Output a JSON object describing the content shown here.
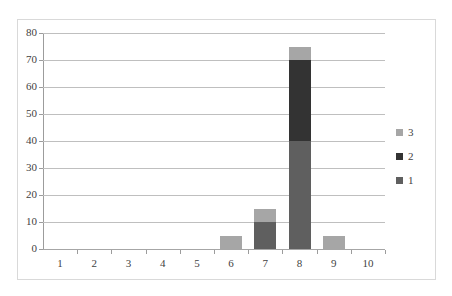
{
  "chart_data": {
    "type": "bar",
    "subtype": "stacked-column",
    "title": "",
    "subtitle": "",
    "xlabel": "",
    "ylabel": "",
    "categories": [
      "1",
      "2",
      "3",
      "4",
      "5",
      "6",
      "7",
      "8",
      "9",
      "10"
    ],
    "series": [
      {
        "name": "1",
        "color": "#5f5f5f",
        "values": [
          0,
          0,
          0,
          0,
          0,
          0,
          10,
          40,
          0,
          0
        ]
      },
      {
        "name": "2",
        "color": "#333333",
        "values": [
          0,
          0,
          0,
          0,
          0,
          0,
          0,
          30,
          0,
          0
        ]
      },
      {
        "name": "3",
        "color": "#a6a6a6",
        "values": [
          0,
          0,
          0,
          0,
          0,
          5,
          5,
          5,
          5,
          0
        ]
      }
    ],
    "totals": [
      0,
      0,
      0,
      0,
      0,
      5,
      15,
      75,
      5,
      0
    ],
    "ylim": [
      0,
      80
    ],
    "ytick_step": 10,
    "ytick_labels": [
      "0",
      "10",
      "20",
      "30",
      "40",
      "50",
      "60",
      "70",
      "80"
    ],
    "grid": true,
    "grid_axis": "y",
    "legend_position": "right",
    "legend_entries": [
      "3",
      "2",
      "1"
    ],
    "plot_background": "#ffffff",
    "gridline_color": "#bfbfbf",
    "border_color": "#d9d9d9",
    "axis_color": "#9c9c9c",
    "text_color": "#3f3f3f"
  }
}
